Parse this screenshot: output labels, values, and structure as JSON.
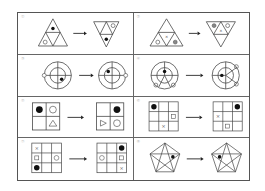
{
  "puzzle": {
    "cells": [
      {
        "label": "①",
        "before": "triangle-4-subdivided-dot-top-circle-bottomleft",
        "after": "inverted-triangle-circle-topright-dot-bottom"
      },
      {
        "label": "②",
        "before": "triangle-4-subdivided-circle-x-shaded",
        "after": "inverted-triangle-shaded-circle-x"
      },
      {
        "label": "③",
        "before": "ring-cross-dot-lowerright-circle-left",
        "after": "ring-cross-dot-upperleft-circle-right"
      },
      {
        "label": "④",
        "before": "ring-spokes-dot-center-circles-bottom",
        "after": "ring-spokes-dot-center-circles-right"
      },
      {
        "label": "⑤",
        "before": "grid2x2-dot-topleft-circle-topright-triangle-bottomright",
        "after": "grid2x2-dot-topright-triangle-bottomleft-circle-bottomright"
      },
      {
        "label": "⑥",
        "before": "grid3x3-dot-topleft-square-right-x-bottom",
        "after": "grid3x3-dot-topright-x-left-square-bottom"
      },
      {
        "label": "⑦",
        "before": "grid3x3-x-square-dot-leftcol-circle-right",
        "after": "grid3x3-dot-square-x-rightcol-circle-left"
      },
      {
        "label": "⑧",
        "before": "pentagram-dot-right",
        "after": "pentagram-dot-left"
      }
    ],
    "arrow": "right-arrow"
  }
}
